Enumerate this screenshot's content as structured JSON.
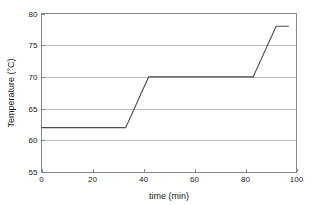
{
  "chart_data": {
    "type": "line",
    "title": "",
    "xlabel": "time (min)",
    "ylabel": "Temperature (°C)",
    "xlim": [
      0,
      100
    ],
    "ylim": [
      55,
      80
    ],
    "xticks": [
      0,
      20,
      40,
      60,
      80,
      100
    ],
    "yticks": [
      55,
      60,
      65,
      70,
      75,
      80
    ],
    "xtick_labels": [
      "0",
      "20",
      "40",
      "60",
      "80",
      "100"
    ],
    "ytick_labels": [
      "55",
      "60",
      "65",
      "70",
      "75",
      "80"
    ],
    "grid": "horizontal",
    "legend": "none",
    "series": [
      {
        "name": "temperature program",
        "x": [
          0,
          33,
          42,
          83,
          92,
          97
        ],
        "y": [
          62,
          62,
          70,
          70,
          78,
          78
        ]
      }
    ],
    "annotations": [],
    "colors": {
      "line": "#4d4d4d",
      "grid": "#b4b4b4",
      "frame": "#7a7a7a",
      "background": "#ffffff",
      "text": "#1a1a1a"
    }
  }
}
